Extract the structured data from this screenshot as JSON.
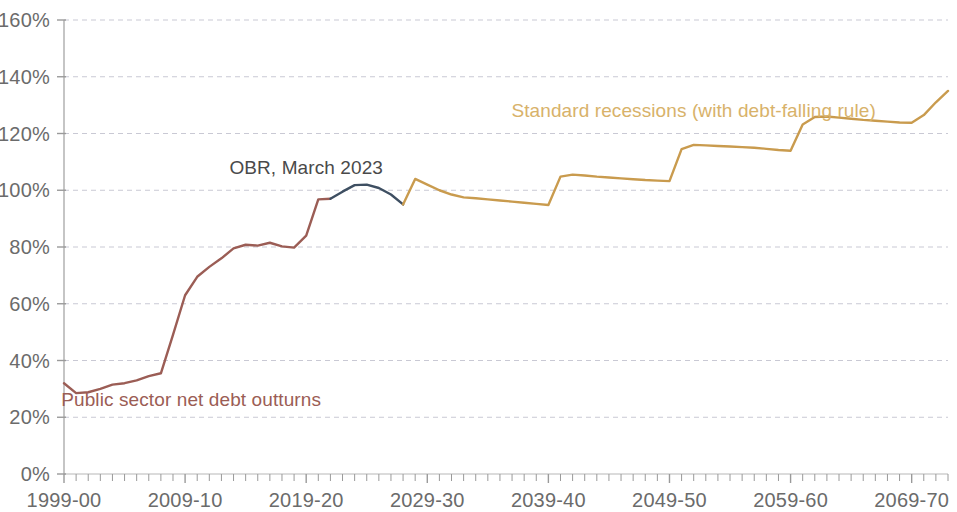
{
  "chart_data": {
    "type": "line",
    "title": "",
    "xlabel": "",
    "ylabel": "",
    "ylim": [
      0,
      160
    ],
    "ytick_labels": [
      "0%",
      "20%",
      "40%",
      "60%",
      "80%",
      "100%",
      "120%",
      "140%",
      "160%"
    ],
    "ytick_values": [
      0,
      20,
      40,
      60,
      80,
      100,
      120,
      140,
      160
    ],
    "xtick_labels": [
      "1999-00",
      "2009-10",
      "2019-20",
      "2029-30",
      "2039-40",
      "2049-50",
      "2059-60",
      "2069-70"
    ],
    "xtick_values": [
      1999,
      2009,
      2019,
      2029,
      2039,
      2049,
      2059,
      2069
    ],
    "xlim": [
      1999,
      2072
    ],
    "grid": "horizontal-dashed",
    "legend": "inline-annotations",
    "annotations": [
      {
        "name": "outturns-label",
        "text": "Public sector net debt outturns",
        "color": "#9b5d55",
        "x": 2009.5,
        "y": 26
      },
      {
        "name": "obr-label",
        "text": "OBR, March 2023",
        "color": "#4a4a4a",
        "x": 2019.0,
        "y": 108
      },
      {
        "name": "standard-recessions-label",
        "text": "Standard recessions (with debt-falling rule)",
        "color": "#d8b26a",
        "x": 2051.0,
        "y": 128
      }
    ],
    "series": [
      {
        "name": "Public sector net debt outturns",
        "color": "#9b5d55",
        "x": [
          1999,
          2000,
          2001,
          2002,
          2003,
          2004,
          2005,
          2006,
          2007,
          2008,
          2009,
          2010,
          2011,
          2012,
          2013,
          2014,
          2015,
          2016,
          2017,
          2018,
          2019,
          2020,
          2021
        ],
        "values": [
          32.0,
          28.5,
          28.8,
          30.0,
          31.5,
          32.0,
          33.0,
          34.5,
          35.5,
          49.0,
          63.0,
          69.5,
          73.0,
          76.0,
          79.5,
          80.8,
          80.5,
          81.5,
          80.2,
          79.8,
          84.0,
          96.8,
          97.0
        ]
      },
      {
        "name": "OBR, March 2023",
        "color": "#3e4f62",
        "x": [
          2021,
          2022,
          2023,
          2024,
          2025,
          2026,
          2027
        ],
        "values": [
          97.0,
          99.5,
          101.8,
          102.0,
          100.8,
          98.5,
          95.0
        ]
      },
      {
        "name": "Standard recessions (with debt-falling rule)",
        "color": "#c99b4e",
        "x": [
          2027,
          2028,
          2029,
          2030,
          2031,
          2032,
          2033,
          2034,
          2035,
          2036,
          2037,
          2038,
          2039,
          2040,
          2041,
          2042,
          2043,
          2044,
          2045,
          2046,
          2047,
          2048,
          2049,
          2050,
          2051,
          2052,
          2053,
          2054,
          2055,
          2056,
          2057,
          2058,
          2059,
          2060,
          2061,
          2062,
          2063,
          2064,
          2065,
          2066,
          2067,
          2068,
          2069,
          2070,
          2071,
          2072
        ],
        "values": [
          95.0,
          104.0,
          102.0,
          100.0,
          98.5,
          97.5,
          97.2,
          96.8,
          96.4,
          96.0,
          95.6,
          95.2,
          94.8,
          104.8,
          105.5,
          105.2,
          104.8,
          104.5,
          104.2,
          103.9,
          103.6,
          103.4,
          103.2,
          114.5,
          116.0,
          115.8,
          115.6,
          115.4,
          115.2,
          115.0,
          114.6,
          114.2,
          113.9,
          123.2,
          125.8,
          126.0,
          125.6,
          125.2,
          124.8,
          124.5,
          124.2,
          123.9,
          123.8,
          126.5,
          131.0,
          135.0
        ]
      }
    ]
  }
}
